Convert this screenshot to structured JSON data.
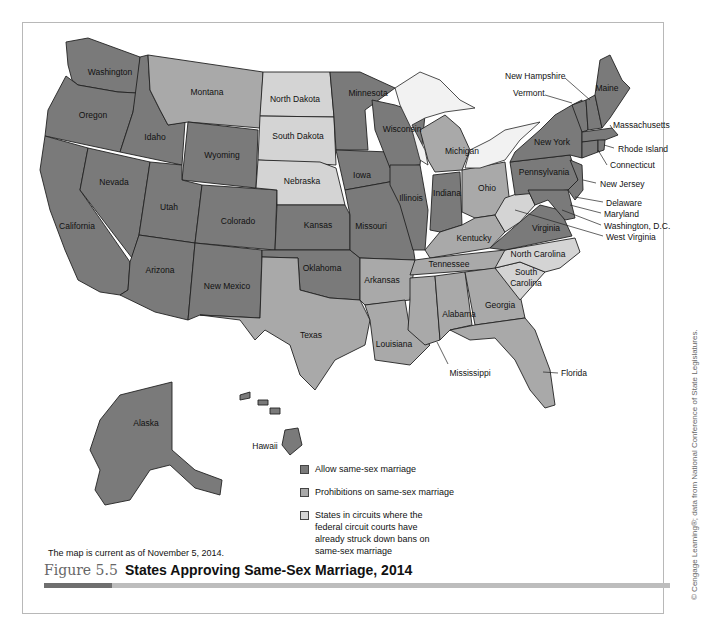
{
  "figure": {
    "number": "Figure 5.5",
    "title": "States Approving Same-Sex Marriage, 2014",
    "note": "The map is current as of November 5, 2014.",
    "credit": "© Cengage Learning®; data from National Conference of State Legislatures."
  },
  "legend": {
    "items": [
      {
        "key": "allow",
        "label": "Allow same-sex marriage",
        "color": "#7a7a7a"
      },
      {
        "key": "prohib",
        "label": "Prohibitions on same-sex marriage",
        "color": "#a9a9a9"
      },
      {
        "key": "circuit",
        "label": "States in circuits where the federal circuit courts have already struck down bans on same-sex marriage",
        "color": "#d4d4d4"
      }
    ]
  },
  "states": {
    "washington": "Washington",
    "oregon": "Oregon",
    "california": "California",
    "nevada": "Nevada",
    "idaho": "Idaho",
    "montana": "Montana",
    "wyoming": "Wyoming",
    "utah": "Utah",
    "arizona": "Arizona",
    "colorado": "Colorado",
    "new_mexico": "New Mexico",
    "north_dakota": "North Dakota",
    "south_dakota": "South Dakota",
    "nebraska": "Nebraska",
    "kansas": "Kansas",
    "oklahoma": "Oklahoma",
    "texas": "Texas",
    "minnesota": "Minnesota",
    "iowa": "Iowa",
    "missouri": "Missouri",
    "arkansas": "Arkansas",
    "louisiana": "Louisiana",
    "wisconsin": "Wisconsin",
    "illinois": "Illinois",
    "michigan": "Michigan",
    "indiana": "Indiana",
    "ohio": "Ohio",
    "kentucky": "Kentucky",
    "tennessee": "Tennessee",
    "mississippi": "Mississippi",
    "alabama": "Alabama",
    "georgia": "Georgia",
    "florida": "Florida",
    "south_carolina": "South\nCarolina",
    "north_carolina": "North Carolina",
    "virginia": "Virginia",
    "west_virginia": "West Virginia",
    "pennsylvania": "Pennsylvania",
    "new_york": "New York",
    "vermont": "Vermont",
    "new_hampshire": "New Hampshire",
    "maine": "Maine",
    "massachusetts": "Massachusetts",
    "rhode_island": "Rhode Island",
    "connecticut": "Connecticut",
    "new_jersey": "New Jersey",
    "delaware": "Delaware",
    "maryland": "Maryland",
    "washington_dc": "Washington, D.C.",
    "alaska": "Alaska",
    "hawaii": "Hawaii"
  },
  "status": {
    "allow": [
      "Washington",
      "Oregon",
      "California",
      "Nevada",
      "Idaho",
      "Wyoming",
      "Utah",
      "Arizona",
      "Colorado",
      "New Mexico",
      "Kansas",
      "Oklahoma",
      "Minnesota",
      "Iowa",
      "Missouri",
      "Wisconsin",
      "Illinois",
      "Indiana",
      "Virginia",
      "Pennsylvania",
      "New York",
      "Vermont",
      "New Hampshire",
      "Maine",
      "Massachusetts",
      "Rhode Island",
      "Connecticut",
      "New Jersey",
      "Delaware",
      "Maryland",
      "Washington, D.C.",
      "Alaska",
      "Hawaii"
    ],
    "prohib": [
      "Montana",
      "Texas",
      "Arkansas",
      "Louisiana",
      "Michigan",
      "Ohio",
      "Kentucky",
      "Tennessee",
      "Mississippi",
      "Alabama",
      "Georgia",
      "Florida"
    ],
    "circuit": [
      "North Dakota",
      "South Dakota",
      "Nebraska",
      "West Virginia",
      "North Carolina",
      "South Carolina"
    ]
  }
}
